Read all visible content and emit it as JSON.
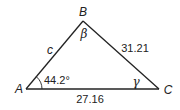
{
  "figure": {
    "type": "triangle",
    "colors": {
      "stroke": "#222222",
      "background": "#ffffff"
    },
    "vertices": {
      "A": {
        "label": "A",
        "x": 26,
        "y": 89
      },
      "B": {
        "label": "B",
        "x": 83,
        "y": 21
      },
      "C": {
        "label": "C",
        "x": 159,
        "y": 89
      }
    },
    "angles": {
      "A": {
        "label": "44.2°"
      },
      "B": {
        "label": "β"
      },
      "C": {
        "label": "γ"
      }
    },
    "sides": {
      "AB": {
        "label": "c"
      },
      "BC": {
        "label": "31.21"
      },
      "AC": {
        "label": "27.16"
      }
    }
  }
}
